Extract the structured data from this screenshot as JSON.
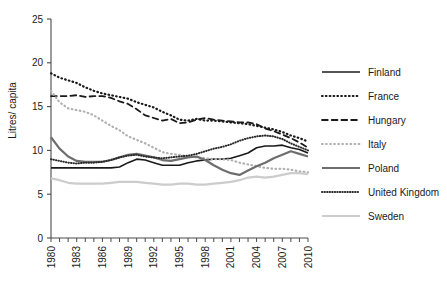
{
  "chart_data": {
    "type": "line",
    "title": "",
    "xlabel": "",
    "ylabel": "Litres/ capita",
    "xlim": [
      1980,
      2010
    ],
    "ylim": [
      0,
      25
    ],
    "yticks": [
      0,
      5,
      10,
      15,
      20,
      25
    ],
    "xticks": [
      1980,
      1983,
      1986,
      1989,
      1992,
      1995,
      1998,
      2001,
      2004,
      2007,
      2010
    ],
    "xtick_labels": [
      "1980",
      "1983",
      "1986",
      "1989",
      "1992",
      "1995",
      "1998",
      "2001",
      "2004",
      "2007",
      "2010"
    ],
    "ytick_labels": [
      "0",
      "5",
      "10",
      "15",
      "20",
      "25"
    ],
    "xtick_minor_step": 1,
    "grid": false,
    "legend_position": "right",
    "x": [
      1980,
      1981,
      1982,
      1983,
      1984,
      1985,
      1986,
      1987,
      1988,
      1989,
      1990,
      1991,
      1992,
      1993,
      1994,
      1995,
      1996,
      1997,
      1998,
      1999,
      2000,
      2001,
      2002,
      2003,
      2004,
      2005,
      2006,
      2007,
      2008,
      2009,
      2010
    ],
    "series": [
      {
        "name": "Finland",
        "style": "solid",
        "color": "#1a1a1a",
        "width": 1.6,
        "values": [
          8.0,
          8.0,
          8.0,
          8.0,
          8.0,
          8.0,
          8.0,
          8.0,
          8.1,
          8.6,
          9.0,
          8.9,
          8.6,
          8.3,
          8.3,
          8.3,
          8.6,
          8.8,
          8.9,
          9.0,
          9.0,
          9.1,
          9.4,
          9.7,
          10.3,
          10.5,
          10.5,
          10.6,
          10.3,
          10.1,
          9.7
        ]
      },
      {
        "name": "France",
        "style": "dotted-bold",
        "color": "#1a1a1a",
        "width": 2.2,
        "values": [
          18.8,
          18.3,
          18.0,
          17.7,
          17.2,
          16.8,
          16.5,
          16.3,
          16.1,
          15.9,
          15.5,
          15.2,
          14.9,
          14.4,
          14.0,
          13.5,
          13.4,
          13.6,
          13.4,
          13.4,
          13.3,
          13.2,
          13.1,
          13.0,
          12.8,
          12.6,
          12.4,
          12.1,
          11.7,
          11.4,
          11.0
        ]
      },
      {
        "name": "Hungary",
        "style": "dashed",
        "color": "#1a1a1a",
        "width": 1.8,
        "values": [
          16.2,
          16.2,
          16.2,
          16.3,
          16.1,
          16.2,
          16.2,
          16.0,
          15.6,
          15.3,
          14.7,
          14.0,
          13.7,
          13.4,
          13.6,
          13.1,
          13.2,
          13.5,
          13.7,
          13.5,
          13.4,
          13.3,
          13.2,
          13.2,
          13.0,
          12.5,
          12.2,
          11.8,
          11.4,
          10.9,
          10.3
        ]
      },
      {
        "name": "Italy",
        "style": "dotted-light",
        "color": "#b0b0b0",
        "width": 2.2,
        "values": [
          16.8,
          15.5,
          14.8,
          14.6,
          14.4,
          14.0,
          13.4,
          12.8,
          12.3,
          11.6,
          11.2,
          10.8,
          10.3,
          9.8,
          9.6,
          9.5,
          9.3,
          9.2,
          9.1,
          9.0,
          9.0,
          8.9,
          8.6,
          8.4,
          8.2,
          8.0,
          7.9,
          7.9,
          7.8,
          7.6,
          7.5
        ]
      },
      {
        "name": "Poland",
        "style": "solid",
        "color": "#6e6e6e",
        "width": 2.2,
        "values": [
          11.5,
          10.2,
          9.3,
          8.8,
          8.7,
          8.7,
          8.7,
          8.9,
          9.2,
          9.5,
          9.6,
          9.4,
          9.2,
          8.9,
          8.8,
          9.0,
          9.2,
          9.3,
          8.9,
          8.3,
          7.8,
          7.4,
          7.2,
          7.7,
          8.2,
          8.6,
          9.1,
          9.5,
          9.9,
          9.6,
          9.3
        ]
      },
      {
        "name": "United Kingdom",
        "style": "dotted-fine",
        "color": "#2a2a2a",
        "width": 2.0,
        "values": [
          9.0,
          8.8,
          8.6,
          8.5,
          8.6,
          8.6,
          8.7,
          8.9,
          9.2,
          9.4,
          9.5,
          9.3,
          9.2,
          9.1,
          9.2,
          9.3,
          9.4,
          9.6,
          9.9,
          10.2,
          10.4,
          10.7,
          11.1,
          11.4,
          11.6,
          11.7,
          11.6,
          11.3,
          10.8,
          10.4,
          10.0
        ]
      },
      {
        "name": "Sweden",
        "style": "solid",
        "color": "#cccccc",
        "width": 2.2,
        "values": [
          6.8,
          6.6,
          6.3,
          6.2,
          6.2,
          6.2,
          6.2,
          6.3,
          6.4,
          6.4,
          6.4,
          6.3,
          6.2,
          6.1,
          6.1,
          6.2,
          6.2,
          6.1,
          6.1,
          6.2,
          6.3,
          6.4,
          6.6,
          6.9,
          7.0,
          6.9,
          7.0,
          7.2,
          7.4,
          7.4,
          7.3
        ]
      }
    ]
  },
  "legend": {
    "items": [
      {
        "label": "Finland"
      },
      {
        "label": "France"
      },
      {
        "label": "Hungary"
      },
      {
        "label": "Italy"
      },
      {
        "label": "Poland"
      },
      {
        "label": "United Kingdom"
      },
      {
        "label": "Sweden"
      }
    ]
  }
}
